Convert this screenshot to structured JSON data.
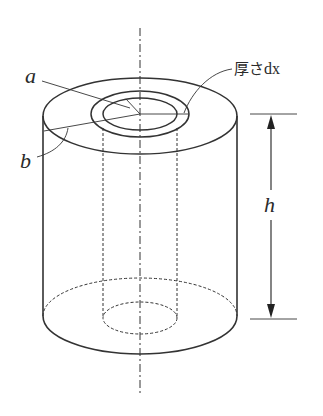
{
  "figure": {
    "labels": {
      "inner_radius": "a",
      "outer_radius": "b",
      "height": "h",
      "shell_thickness_prefix": "厚さ",
      "shell_thickness_var": "dx"
    },
    "colors": {
      "line": "#333333",
      "background": "#ffffff"
    }
  }
}
